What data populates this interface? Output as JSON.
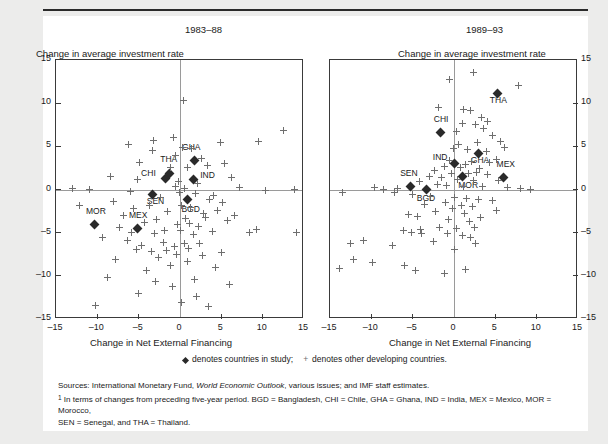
{
  "figure": {
    "cutoff_text": "",
    "left_panel": {
      "period_title": "1983–88",
      "y_axis_title": "Change in average investment rate",
      "x_axis_title": "Change in Net External Financing"
    },
    "right_panel": {
      "period_title": "1989–93",
      "y_axis_title": "Change in average investment rate",
      "x_axis_title": "Change in Net External Financing"
    },
    "legend": {
      "diamond_text": "denotes countries in study;",
      "cross_text": "denotes other developing countries.",
      "cross_glyph": "+"
    },
    "notes": {
      "sources": "Sources: International Monetary Fund, ",
      "sources_italic": "World Economic Outlook",
      "sources_rest": ", various issues; and IMF staff estimates.",
      "footnote_marker": "1",
      "footnote_line1": " In terms of changes from preceding five-year period. BGD = Bangladesh, CHI = Chile, GHA = Ghana, IND = India, MEX = Mexico, MOR = Morocco,",
      "footnote_line2": "SEN = Senegal, and THA = Thailand."
    }
  },
  "chart_data": [
    {
      "type": "scatter",
      "title": "1983–88",
      "xlabel": "Change in Net External Financing",
      "ylabel": "Change in average investment rate",
      "xlim": [
        -15,
        15
      ],
      "ylim": [
        -15,
        15
      ],
      "xticks": [
        -15,
        -10,
        -5,
        0,
        5,
        10,
        15
      ],
      "yticks": [
        -15,
        -10,
        -5,
        0,
        5,
        10,
        15
      ],
      "grid": false,
      "legend_position": "below",
      "series": [
        {
          "name": "countries in study",
          "marker": "diamond",
          "points": [
            {
              "label": "GHA",
              "x": 1.7,
              "y": 3.4,
              "label_dx": -12,
              "label_dy": -13
            },
            {
              "label": "THA",
              "x": -1.3,
              "y": 1.9,
              "label_dx": -9,
              "label_dy": -14
            },
            {
              "label": "CHI",
              "x": -1.8,
              "y": 1.3,
              "label_dx": -24,
              "label_dy": -5
            },
            {
              "label": "IND",
              "x": 1.6,
              "y": 1.2,
              "label_dx": 7,
              "label_dy": -4
            },
            {
              "label": "SEN",
              "x": -3.3,
              "y": -0.6,
              "label_dx": -6,
              "label_dy": 6
            },
            {
              "label": "BGD",
              "x": 0.9,
              "y": -1.2,
              "label_dx": -6,
              "label_dy": 9
            },
            {
              "label": "MOR",
              "x": -10.4,
              "y": -4.0,
              "label_dx": -8,
              "label_dy": -13
            },
            {
              "label": "MEX",
              "x": -5.2,
              "y": -4.5,
              "label_dx": -8,
              "label_dy": -13
            }
          ]
        },
        {
          "name": "other developing countries",
          "marker": "cross",
          "points": [
            [
              0.4,
              10.3
            ],
            [
              12.5,
              6.8
            ],
            [
              -0.8,
              6.0
            ],
            [
              -3.2,
              5.7
            ],
            [
              4.9,
              5.5
            ],
            [
              -6.2,
              5.2
            ],
            [
              0.3,
              4.9
            ],
            [
              1.4,
              4.8
            ],
            [
              -3.3,
              4.5
            ],
            [
              9.5,
              5.6
            ],
            [
              -0.6,
              3.9
            ],
            [
              2.6,
              3.6
            ],
            [
              5.4,
              3.0
            ],
            [
              -4.9,
              3.1
            ],
            [
              3.3,
              2.8
            ],
            [
              -1.1,
              2.6
            ],
            [
              0.9,
              2.5
            ],
            [
              -8.4,
              1.5
            ],
            [
              6.2,
              1.4
            ],
            [
              -5.1,
              1.2
            ],
            [
              -0.2,
              0.9
            ],
            [
              2.1,
              0.7
            ],
            [
              -0.6,
              0.3
            ],
            [
              0.6,
              0.1
            ],
            [
              -0.1,
              -0.3
            ],
            [
              1.9,
              -0.5
            ],
            [
              4.1,
              -0.7
            ],
            [
              -2.3,
              -0.9
            ],
            [
              3.6,
              -1.2
            ],
            [
              -8.1,
              -1.4
            ],
            [
              5.2,
              -1.5
            ],
            [
              -3.7,
              -1.8
            ],
            [
              0.2,
              -1.9
            ],
            [
              1.3,
              -2.1
            ],
            [
              -5.6,
              -2.2
            ],
            [
              4.5,
              -2.4
            ],
            [
              -1.5,
              -2.6
            ],
            [
              2.9,
              -2.8
            ],
            [
              -6.8,
              -3.0
            ],
            [
              3.1,
              -3.2
            ],
            [
              0.7,
              -3.4
            ],
            [
              -2.9,
              -3.5
            ],
            [
              5.8,
              -3.6
            ],
            [
              -4.3,
              -3.8
            ],
            [
              1.1,
              -3.9
            ],
            [
              -0.3,
              -4.1
            ],
            [
              2.2,
              -4.3
            ],
            [
              -7.3,
              -4.4
            ],
            [
              9.2,
              -4.6
            ],
            [
              -1.9,
              -4.7
            ],
            [
              0.0,
              -4.8
            ],
            [
              3.9,
              -4.9
            ],
            [
              -5.9,
              -5.0
            ],
            [
              -3.1,
              -5.1
            ],
            [
              1.6,
              -5.2
            ],
            [
              -9.4,
              -5.6
            ],
            [
              -6.4,
              -5.9
            ],
            [
              -2.0,
              -6.1
            ],
            [
              0.5,
              -6.2
            ],
            [
              2.4,
              -6.3
            ],
            [
              -4.6,
              -6.5
            ],
            [
              -0.7,
              -6.6
            ],
            [
              1.0,
              -6.8
            ],
            [
              -5.3,
              -7.0
            ],
            [
              -3.5,
              -7.2
            ],
            [
              14.1,
              -5.0
            ],
            [
              8.4,
              -5.0
            ],
            [
              6.6,
              -3.0
            ],
            [
              -12.1,
              -1.9
            ],
            [
              -11.0,
              0.0
            ],
            [
              -6.0,
              -0.2
            ],
            [
              -13.0,
              0.1
            ],
            [
              13.8,
              0.0
            ],
            [
              7.2,
              0.2
            ],
            [
              10.3,
              -0.1
            ],
            [
              -0.4,
              -7.5
            ],
            [
              2.7,
              -7.6
            ],
            [
              -2.6,
              -7.9
            ],
            [
              0.9,
              -8.3
            ],
            [
              -1.2,
              -8.8
            ],
            [
              -4.0,
              -9.4
            ],
            [
              4.3,
              -9.0
            ],
            [
              -8.8,
              -10.2
            ],
            [
              -3.0,
              -10.6
            ],
            [
              1.8,
              -10.4
            ],
            [
              -0.9,
              -11.2
            ],
            [
              6.0,
              -11.0
            ],
            [
              -5.0,
              -12.1
            ],
            [
              2.0,
              -12.4
            ],
            [
              0.2,
              -13.1
            ],
            [
              -10.2,
              -13.4
            ],
            [
              3.4,
              -13.6
            ],
            [
              -1.6,
              -7.1
            ],
            [
              5.0,
              -7.3
            ],
            [
              -7.8,
              -8.1
            ]
          ]
        }
      ]
    },
    {
      "type": "scatter",
      "title": "1989–93",
      "xlabel": "Change in Net External Financing",
      "ylabel": "Change in average investment rate",
      "xlim": [
        -15,
        15
      ],
      "ylim": [
        -15,
        15
      ],
      "xticks": [
        -15,
        -10,
        -5,
        0,
        5,
        10,
        15
      ],
      "yticks": [
        -15,
        -10,
        -5,
        0,
        5,
        10,
        15
      ],
      "grid": false,
      "legend_position": "below",
      "series": [
        {
          "name": "countries in study",
          "marker": "diamond",
          "points": [
            {
              "label": "THA",
              "x": 5.3,
              "y": 11.1,
              "label_dx": -8,
              "label_dy": 6
            },
            {
              "label": "CHI",
              "x": -1.6,
              "y": 6.6,
              "label_dx": -7,
              "label_dy": -14
            },
            {
              "label": "GHA",
              "x": 3.0,
              "y": 4.2,
              "label_dx": -8,
              "label_dy": 7
            },
            {
              "label": "IND",
              "x": 0.1,
              "y": 3.0,
              "label_dx": -22,
              "label_dy": -7
            },
            {
              "label": "MEX",
              "x": 6.0,
              "y": 1.4,
              "label_dx": -7,
              "label_dy": -13
            },
            {
              "label": "MOR",
              "x": 1.0,
              "y": 1.5,
              "label_dx": -4,
              "label_dy": 8
            },
            {
              "label": "SEN",
              "x": -5.3,
              "y": 0.3,
              "label_dx": -10,
              "label_dy": -14
            },
            {
              "label": "BGD",
              "x": -3.3,
              "y": 0.0,
              "label_dx": -10,
              "label_dy": 8
            }
          ]
        },
        {
          "name": "other developing countries",
          "marker": "cross",
          "points": [
            [
              2.3,
              13.6
            ],
            [
              -0.5,
              12.7
            ],
            [
              7.8,
              12.1
            ],
            [
              -1.9,
              9.5
            ],
            [
              1.2,
              9.3
            ],
            [
              2.0,
              9.2
            ],
            [
              3.3,
              8.3
            ],
            [
              4.1,
              7.9
            ],
            [
              1.0,
              7.6
            ],
            [
              2.6,
              7.5
            ],
            [
              3.6,
              7.1
            ],
            [
              0.3,
              6.7
            ],
            [
              4.7,
              6.3
            ],
            [
              5.6,
              5.6
            ],
            [
              2.9,
              5.4
            ],
            [
              0.6,
              5.2
            ],
            [
              6.1,
              4.9
            ],
            [
              -0.1,
              4.8
            ],
            [
              1.6,
              4.6
            ],
            [
              3.9,
              4.4
            ],
            [
              5.1,
              3.5
            ],
            [
              -0.6,
              3.4
            ],
            [
              2.1,
              3.2
            ],
            [
              4.3,
              3.1
            ],
            [
              1.4,
              2.9
            ],
            [
              -1.2,
              2.7
            ],
            [
              0.8,
              2.5
            ],
            [
              3.1,
              2.4
            ],
            [
              -2.4,
              2.2
            ],
            [
              2.7,
              2.0
            ],
            [
              -0.3,
              1.9
            ],
            [
              1.8,
              1.8
            ],
            [
              4.0,
              1.7
            ],
            [
              -3.0,
              1.5
            ],
            [
              -1.5,
              1.4
            ],
            [
              0.4,
              1.2
            ],
            [
              2.4,
              1.1
            ],
            [
              5.4,
              1.0
            ],
            [
              -4.2,
              0.9
            ],
            [
              -2.0,
              0.6
            ],
            [
              -0.9,
              0.5
            ],
            [
              1.1,
              0.4
            ],
            [
              3.5,
              0.3
            ],
            [
              6.5,
              0.2
            ],
            [
              -6.8,
              0.1
            ],
            [
              -8.5,
              0.0
            ],
            [
              -9.6,
              0.2
            ],
            [
              8.0,
              0.1
            ],
            [
              9.2,
              0.0
            ],
            [
              -13.5,
              -0.3
            ],
            [
              -7.2,
              -0.4
            ],
            [
              -5.0,
              -0.6
            ],
            [
              -2.8,
              -0.8
            ],
            [
              0.1,
              -0.9
            ],
            [
              1.5,
              -1.0
            ],
            [
              3.0,
              -1.2
            ],
            [
              4.6,
              -1.3
            ],
            [
              -1.0,
              -1.5
            ],
            [
              -3.6,
              -1.7
            ],
            [
              0.9,
              -1.8
            ],
            [
              2.2,
              -2.0
            ],
            [
              -0.2,
              -2.2
            ],
            [
              5.2,
              -2.4
            ],
            [
              -2.2,
              -2.6
            ],
            [
              1.3,
              -2.8
            ],
            [
              -5.5,
              -2.9
            ],
            [
              -4.4,
              -3.1
            ],
            [
              3.2,
              -3.3
            ],
            [
              -0.7,
              -3.5
            ],
            [
              1.9,
              -3.7
            ],
            [
              -1.8,
              -4.4
            ],
            [
              -4.0,
              -4.6
            ],
            [
              -6.1,
              -4.7
            ],
            [
              0.3,
              -4.5
            ],
            [
              2.5,
              -4.4
            ],
            [
              -0.8,
              -5.1
            ],
            [
              1.0,
              -5.3
            ],
            [
              2.0,
              -5.6
            ],
            [
              -3.9,
              -5.1
            ],
            [
              -5.1,
              -5.0
            ],
            [
              -12.5,
              -6.2
            ],
            [
              -10.9,
              -5.9
            ],
            [
              -7.4,
              -6.5
            ],
            [
              -9.9,
              -8.5
            ],
            [
              -12.2,
              -8.1
            ],
            [
              -6.0,
              -8.8
            ],
            [
              -4.6,
              -9.4
            ],
            [
              -1.1,
              -9.7
            ],
            [
              1.4,
              -9.3
            ],
            [
              -13.8,
              -9.1
            ],
            [
              2.6,
              -6.3
            ],
            [
              -2.5,
              -6.0
            ],
            [
              0.0,
              -6.9
            ]
          ]
        }
      ]
    }
  ]
}
